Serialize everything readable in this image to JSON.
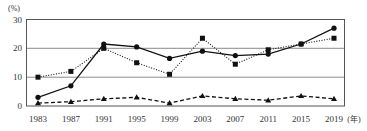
{
  "chart_data": {
    "type": "line",
    "title": "",
    "xlabel": "年",
    "ylabel": "(%)",
    "ylim": [
      0,
      30
    ],
    "yticks": [
      0,
      10,
      20,
      30
    ],
    "grid": true,
    "legend_position": "none",
    "categories": [
      "1983",
      "1987",
      "1991",
      "1995",
      "1999",
      "2003",
      "2007",
      "2011",
      "2015",
      "2019"
    ],
    "series": [
      {
        "name": "series-circle-solid",
        "marker": "circle",
        "linestyle": "solid",
        "values": [
          3,
          7,
          21.5,
          20.5,
          16.5,
          19,
          17.5,
          18,
          21.5,
          27
        ]
      },
      {
        "name": "series-square-dotted",
        "marker": "square",
        "linestyle": "dotted",
        "values": [
          10,
          12,
          20,
          15,
          11,
          23.5,
          14.5,
          19.5,
          21.5,
          23.5
        ]
      },
      {
        "name": "series-triangle-dashed",
        "marker": "triangle",
        "linestyle": "dashed",
        "values": [
          1,
          1.5,
          2.5,
          3,
          1,
          3.5,
          2.5,
          2,
          3.5,
          2.5
        ]
      }
    ]
  },
  "axis": {
    "y_unit_label": "(%)",
    "x_unit_label": "(年)",
    "y_tick_labels": [
      "30",
      "20",
      "10",
      "0"
    ],
    "x_tick_labels": [
      "1983",
      "1987",
      "1991",
      "1995",
      "1999",
      "2003",
      "2007",
      "2011",
      "2015",
      "2019"
    ]
  }
}
